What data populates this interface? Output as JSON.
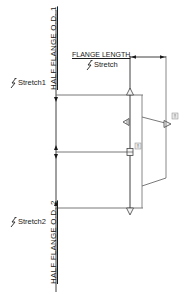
{
  "drawing": {
    "dimension_labels": {
      "half_flange_od_1": "HALF FLANGE O.D. 1",
      "half_flange_od_2": "HALF FLANGE O.D. 2",
      "flange_length": "FLANGE LENGTH"
    },
    "parameters": [
      {
        "id": "stretch1",
        "label": "Stretch1",
        "icon": "stretch-action-icon"
      },
      {
        "id": "stretch",
        "label": "Stretch",
        "icon": "stretch-action-icon"
      },
      {
        "id": "stretch2",
        "label": "Stretch2",
        "icon": "stretch-action-icon"
      }
    ],
    "grips": [
      {
        "type": "linear-grip-up",
        "icon": "triangle-up-grip-icon"
      },
      {
        "type": "linear-grip-left",
        "icon": "triangle-left-grip-icon"
      },
      {
        "type": "linear-grip-right",
        "icon": "triangle-right-grip-icon"
      },
      {
        "type": "point-grip",
        "icon": "point-grip-icon"
      },
      {
        "type": "linear-grip-down",
        "icon": "triangle-down-grip-icon"
      }
    ],
    "alert_badges": [
      "!",
      "!"
    ],
    "colors": {
      "background": "#ffffff",
      "line": "#2a2a2a",
      "geometry": "#7a7a7a",
      "text": "#1a1a1a"
    }
  }
}
